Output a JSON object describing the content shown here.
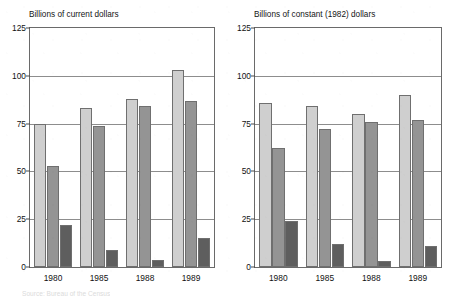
{
  "chart_data": [
    {
      "type": "bar",
      "title": "Billions of current dollars",
      "xlabel": "",
      "ylabel": "",
      "categories": [
        "1980",
        "1985",
        "1988",
        "1989"
      ],
      "series": [
        {
          "name": "series-1",
          "color": "#cfcfcf",
          "values": [
            75,
            83,
            88,
            103
          ]
        },
        {
          "name": "series-2",
          "color": "#949494",
          "values": [
            53,
            74,
            84,
            87
          ]
        },
        {
          "name": "series-3",
          "color": "#5e5e5e",
          "values": [
            22,
            9,
            3.5,
            15
          ]
        }
      ],
      "ylim": [
        0,
        125
      ],
      "yticks": [
        0,
        25,
        50,
        75,
        100,
        125
      ],
      "grid": true,
      "legend": "none"
    },
    {
      "type": "bar",
      "title": "Billions of constant (1982) dollars",
      "xlabel": "",
      "ylabel": "",
      "categories": [
        "1980",
        "1985",
        "1988",
        "1989"
      ],
      "series": [
        {
          "name": "series-1",
          "color": "#cfcfcf",
          "values": [
            86,
            84,
            80,
            90
          ]
        },
        {
          "name": "series-2",
          "color": "#949494",
          "values": [
            62,
            72,
            76,
            77
          ]
        },
        {
          "name": "series-3",
          "color": "#5e5e5e",
          "values": [
            24,
            12,
            3,
            11
          ]
        }
      ],
      "ylim": [
        0,
        125
      ],
      "yticks": [
        0,
        25,
        50,
        75,
        100,
        125
      ],
      "grid": true,
      "legend": "none"
    }
  ],
  "footer": {
    "source_note": "Source: Bureau of the Census"
  }
}
